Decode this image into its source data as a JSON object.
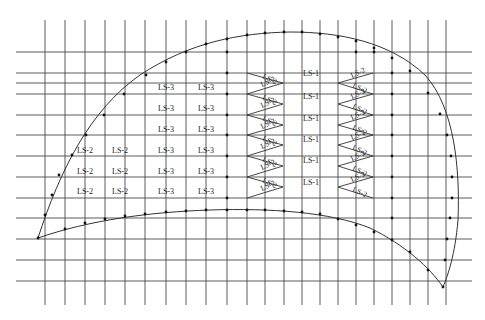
{
  "diagram": {
    "colors": {
      "line": "#4a4a4a",
      "curve": "#333333",
      "dot": "#111111",
      "text": "#222222",
      "background": "#ffffff"
    },
    "grid": {
      "vertical_x": [
        45,
        65,
        85,
        105,
        125,
        145,
        166,
        186,
        206,
        227,
        247,
        265,
        284,
        302,
        320,
        338,
        356,
        374,
        392,
        410,
        428,
        446
      ],
      "vertical_y_range": [
        20,
        305
      ],
      "horizontal_y": [
        52,
        73,
        83,
        94,
        115,
        135,
        156,
        177,
        198,
        218,
        239,
        260,
        281
      ],
      "horizontal_x_range": [
        16,
        472
      ]
    },
    "zones": {
      "ls1": {
        "label": "LS-1",
        "rows_y": [
          76,
          99,
          121,
          142,
          163,
          185
        ],
        "x": 311
      },
      "ls3": [
        {
          "label": "LS-3",
          "x": 166,
          "y": 90
        },
        {
          "label": "LS-3",
          "x": 206,
          "y": 90
        },
        {
          "label": "LS-3",
          "x": 166,
          "y": 111
        },
        {
          "label": "LS-3",
          "x": 206,
          "y": 111
        },
        {
          "label": "LS-3",
          "x": 166,
          "y": 132
        },
        {
          "label": "LS-3",
          "x": 206,
          "y": 132
        },
        {
          "label": "LS-3",
          "x": 166,
          "y": 153
        },
        {
          "label": "LS-3",
          "x": 206,
          "y": 153
        },
        {
          "label": "LS-3",
          "x": 166,
          "y": 174
        },
        {
          "label": "LS-3",
          "x": 206,
          "y": 174
        },
        {
          "label": "LS-3",
          "x": 166,
          "y": 194
        },
        {
          "label": "LS-3",
          "x": 206,
          "y": 194
        }
      ],
      "ls2_left": [
        {
          "label": "LS-2",
          "x": 85,
          "y": 153
        },
        {
          "label": "LS-2",
          "x": 120,
          "y": 153
        },
        {
          "label": "LS-2",
          "x": 85,
          "y": 174
        },
        {
          "label": "LS-2",
          "x": 120,
          "y": 174
        },
        {
          "label": "LS-2",
          "x": 85,
          "y": 194
        },
        {
          "label": "LS-2",
          "x": 120,
          "y": 194
        }
      ],
      "ls2_diagonal_label": "LS-2"
    }
  }
}
